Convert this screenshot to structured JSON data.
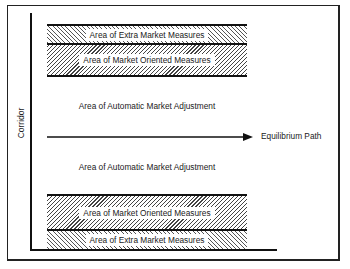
{
  "diagram": {
    "type": "corridor-diagram",
    "axis_label": "Corridor",
    "arrow": {
      "label": "Equilibrium Path",
      "direction": "right"
    },
    "bands_top": [
      {
        "label": "Area of Extra Market Measures",
        "pattern": "backslash-hatch"
      },
      {
        "label": "Area of Market Oriented Measures",
        "pattern": "slash-hatch"
      }
    ],
    "middle_labels": [
      {
        "label": "Area of Automatic Market Adjustment",
        "position": "above-path"
      },
      {
        "label": "Area of Automatic Market Adjustment",
        "position": "below-path"
      }
    ],
    "bands_bottom": [
      {
        "label": "Area of Market Oriented Measures",
        "pattern": "slash-hatch"
      },
      {
        "label": "Area of Extra Market Measures",
        "pattern": "backslash-hatch"
      }
    ],
    "colors": {
      "line": "#111111",
      "hatch": "#444444",
      "background": "#ffffff"
    }
  }
}
